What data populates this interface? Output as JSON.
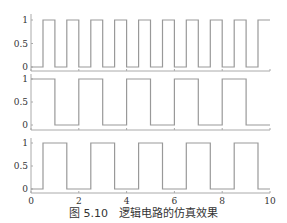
{
  "caption": "图 5.10　逻辑电路的仿真效果",
  "chart_data": {
    "type": "line",
    "title": "",
    "layout": "3 stacked subplots, shared x-axis",
    "xlim": [
      0,
      10
    ],
    "xticks": [
      0,
      2,
      4,
      6,
      8,
      10
    ],
    "grid": false,
    "line_color": "#999999",
    "subplots": [
      {
        "name": "signal-1",
        "ylim": [
          0,
          1
        ],
        "yticks": [
          0,
          0.5,
          1
        ],
        "style": "step",
        "x": [
          0,
          0.5,
          0.5,
          1,
          1,
          1.5,
          1.5,
          2,
          2,
          2.5,
          2.5,
          3,
          3,
          3.5,
          3.5,
          4,
          4,
          4.5,
          4.5,
          5,
          5,
          5.5,
          5.5,
          6,
          6,
          6.5,
          6.5,
          7,
          7,
          7.5,
          7.5,
          8,
          8,
          8.5,
          8.5,
          9,
          9,
          9.5,
          9.5,
          10
        ],
        "y": [
          0,
          0,
          1,
          1,
          0,
          0,
          1,
          1,
          0,
          0,
          1,
          1,
          0,
          0,
          1,
          1,
          0,
          0,
          1,
          1,
          0,
          0,
          1,
          1,
          0,
          0,
          1,
          1,
          0,
          0,
          1,
          1,
          0,
          0,
          1,
          1,
          0,
          0,
          1,
          1
        ]
      },
      {
        "name": "signal-2",
        "ylim": [
          0,
          1
        ],
        "yticks": [
          0,
          0.5,
          1
        ],
        "style": "step",
        "x": [
          0,
          1,
          1,
          2,
          2,
          3,
          3,
          4,
          4,
          5,
          5,
          6,
          6,
          7,
          7,
          8,
          8,
          9,
          9,
          10
        ],
        "y": [
          1,
          1,
          0,
          0,
          1,
          1,
          0,
          0,
          1,
          1,
          0,
          0,
          1,
          1,
          0,
          0,
          1,
          1,
          0,
          0
        ]
      },
      {
        "name": "signal-3",
        "ylim": [
          0,
          1
        ],
        "yticks": [
          0,
          0.5,
          1
        ],
        "style": "step",
        "x": [
          0,
          0.5,
          0.5,
          1.5,
          1.5,
          2.5,
          2.5,
          3.5,
          3.5,
          4.5,
          4.5,
          5.5,
          5.5,
          6.5,
          6.5,
          7.5,
          7.5,
          8.5,
          8.5,
          9.5,
          9.5,
          10
        ],
        "y": [
          0,
          0,
          1,
          1,
          0,
          0,
          1,
          1,
          0,
          0,
          1,
          1,
          0,
          0,
          1,
          1,
          0,
          0,
          1,
          1,
          0,
          0
        ]
      }
    ],
    "xlabel": "",
    "ylabel": ""
  }
}
